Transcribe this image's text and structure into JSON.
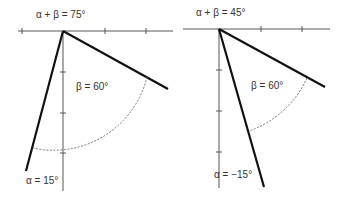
{
  "panels": [
    {
      "title": "α + β = 75°",
      "beta_label": "β = 60°",
      "alpha_label": "α = 15°",
      "alpha_deg": 15,
      "beta_deg": 60,
      "sum_deg": 75
    },
    {
      "title": "α + β = 45°",
      "beta_label": "β = 60°",
      "alpha_label": "α = −15°",
      "alpha_deg": -15,
      "beta_deg": 60,
      "sum_deg": 45
    }
  ],
  "colors": {
    "axis": "#555555",
    "arm": "#111111",
    "arc": "#777777",
    "text": "#333333"
  }
}
